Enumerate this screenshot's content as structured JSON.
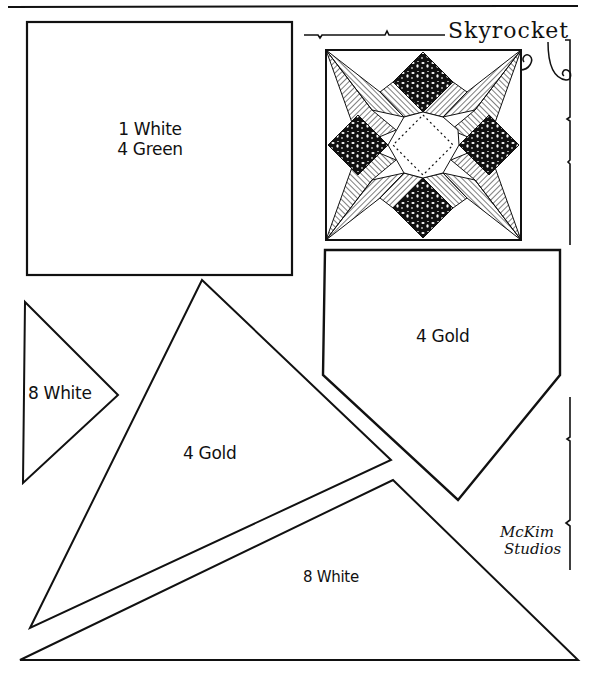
{
  "pattern": {
    "title": "Skyrocket",
    "credit_line1": "McKim",
    "credit_line2": "Studios"
  },
  "pieces": [
    {
      "id": "square",
      "shape": "square",
      "label_line1": "1 White",
      "label_line2": "4 Green"
    },
    {
      "id": "small-triangle",
      "shape": "triangle",
      "label": "8 White"
    },
    {
      "id": "large-triangle",
      "shape": "triangle",
      "label": "4 Gold"
    },
    {
      "id": "pentagon",
      "shape": "pentagon",
      "label": "4 Gold"
    },
    {
      "id": "bottom-triangle",
      "shape": "triangle",
      "label": "8 White"
    }
  ],
  "colors": {
    "ink": "#111111",
    "paper": "#ffffff"
  }
}
